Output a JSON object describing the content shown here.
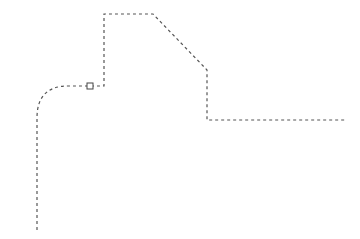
{
  "canvas": {
    "width": 360,
    "height": 239,
    "background": "#ffffff"
  },
  "path": {
    "stroke": "#555555",
    "stroke_width": 1.2,
    "dash": "3 3",
    "d": "M37,230 L37,118 C37,96 48,86 68,86 L104,86 L104,14 L153,14 L207,70 L207,120 L345,120"
  },
  "marker": {
    "x": 87,
    "y": 83,
    "size": 6,
    "stroke": "#444444"
  }
}
